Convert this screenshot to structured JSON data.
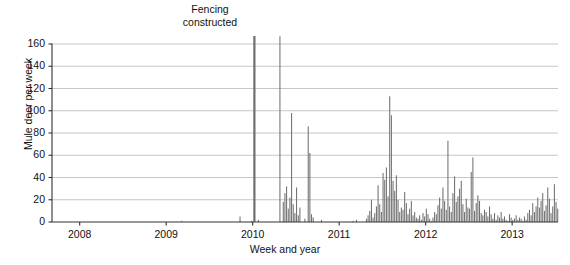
{
  "chart_data": {
    "type": "bar",
    "title": "",
    "xlabel": "Week and year",
    "ylabel": "Mule deer per week",
    "ylim": [
      0,
      160
    ],
    "yticks": [
      0,
      20,
      40,
      60,
      80,
      100,
      120,
      140,
      160
    ],
    "xticks": [
      2008,
      2009,
      2010,
      2011,
      2012,
      2013
    ],
    "xtick_labels": [
      "2008",
      "2009",
      "2010",
      "2011",
      "2012",
      "2013"
    ],
    "xlim": [
      2007.68,
      2013.53
    ],
    "grid": "horizontal",
    "legend": "none",
    "bar_color": "#6e6e6e",
    "axis_color": "#333333",
    "grid_color": "#b8b8b8",
    "annotations": [
      {
        "name": "fencing-constructed",
        "text_line1": "Fencing",
        "text_line2": "constructed",
        "x": 2010.02,
        "value": 167
      }
    ],
    "x_start": 2007.7,
    "x_step": 0.01923,
    "values": [
      0,
      0,
      0,
      0,
      0,
      0,
      0,
      0,
      0,
      0,
      0,
      0,
      0,
      0,
      0,
      0,
      0,
      0,
      0,
      0,
      0,
      0,
      0,
      0,
      0,
      0,
      0,
      0,
      0,
      0,
      0,
      0,
      0,
      0,
      0,
      0,
      0,
      0,
      0,
      0,
      0,
      0,
      0,
      0,
      0,
      0,
      0,
      0,
      0,
      0,
      0,
      0,
      0,
      0,
      0,
      0,
      0,
      0,
      0,
      0,
      0,
      0,
      0,
      0,
      0,
      0,
      0,
      0,
      0,
      0,
      0,
      0,
      0,
      0,
      0,
      0,
      0,
      1,
      0,
      0,
      0,
      0,
      0,
      0,
      0,
      0,
      0,
      0,
      0,
      0,
      0,
      0,
      0,
      0,
      0,
      0,
      0,
      0,
      0,
      0,
      0,
      0,
      0,
      0,
      0,
      0,
      0,
      0,
      0,
      0,
      0,
      0,
      5,
      0,
      0,
      0,
      0,
      0,
      0,
      1,
      1,
      0,
      0,
      2,
      0,
      0,
      0,
      0,
      0,
      0,
      0,
      0,
      0,
      0,
      0,
      0,
      167,
      0,
      18,
      26,
      32,
      12,
      22,
      98,
      16,
      8,
      31,
      6,
      13,
      0,
      0,
      3,
      0,
      86,
      62,
      7,
      4,
      0,
      0,
      0,
      0,
      2,
      0,
      0,
      0,
      0,
      0,
      0,
      0,
      0,
      0,
      0,
      0,
      0,
      0,
      0,
      0,
      0,
      0,
      0,
      1,
      0,
      2,
      0,
      0,
      0,
      0,
      0,
      3,
      6,
      10,
      20,
      4,
      8,
      14,
      33,
      16,
      9,
      44,
      38,
      49,
      23,
      113,
      96,
      37,
      28,
      42,
      20,
      9,
      13,
      11,
      27,
      17,
      7,
      12,
      19,
      6,
      9,
      4,
      3,
      6,
      2,
      8,
      5,
      12,
      7,
      3,
      1,
      4,
      9,
      7,
      15,
      22,
      12,
      31,
      19,
      11,
      73,
      14,
      9,
      26,
      41,
      18,
      23,
      30,
      37,
      16,
      9,
      21,
      13,
      12,
      45,
      58,
      10,
      17,
      24,
      19,
      8,
      6,
      11,
      9,
      5,
      14,
      7,
      3,
      8,
      2,
      6,
      4,
      9,
      3,
      5,
      2,
      1,
      7,
      4,
      2,
      3,
      6,
      2,
      4,
      3,
      1,
      5,
      2,
      8,
      11,
      6,
      17,
      9,
      14,
      22,
      13,
      19,
      26,
      10,
      15,
      31,
      21,
      8,
      14,
      34,
      18,
      12,
      25,
      40,
      17,
      23,
      11,
      9,
      16,
      7,
      5,
      12,
      8,
      4,
      13,
      6,
      3,
      9,
      2,
      7,
      4,
      10,
      5,
      3,
      8,
      2,
      6,
      4,
      9,
      3,
      5,
      2,
      4,
      7,
      11,
      9,
      22,
      16,
      28,
      13,
      31,
      19,
      45,
      24,
      103,
      53,
      38,
      155,
      65,
      47,
      29,
      21,
      14,
      33,
      26,
      18,
      42,
      23,
      11,
      17,
      9,
      55,
      88,
      36,
      24,
      14,
      46,
      19,
      8,
      12,
      31,
      22,
      7,
      15,
      5,
      9,
      3,
      6,
      11,
      4,
      8,
      2,
      5,
      3,
      7,
      2,
      9,
      4,
      12,
      6,
      30,
      44,
      18,
      7,
      9,
      3,
      6,
      2,
      5,
      1,
      3,
      8,
      4,
      2,
      5,
      3,
      10,
      2,
      6,
      1,
      4,
      3,
      0,
      1,
      0,
      2,
      0,
      1,
      0,
      2,
      1,
      0,
      3,
      1,
      2,
      0,
      12,
      34,
      166,
      98,
      72,
      46,
      53,
      27,
      19,
      11,
      24,
      16,
      9,
      28,
      13,
      7,
      18,
      10,
      5,
      12,
      6,
      3,
      8,
      4,
      2,
      5
    ]
  },
  "y_axis": {
    "labels": [
      "160",
      "140",
      "120",
      "100",
      "80",
      "60",
      "40",
      "20",
      "0"
    ],
    "title": "Mule deer per week"
  },
  "x_axis": {
    "labels": [
      "2008",
      "2009",
      "2010",
      "2011",
      "2012",
      "2013"
    ],
    "title": "Week and year"
  },
  "annotation": {
    "line1": "Fencing",
    "line2": "constructed"
  }
}
